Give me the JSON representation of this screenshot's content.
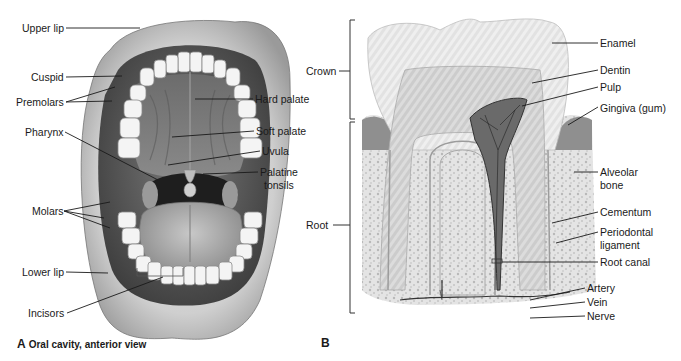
{
  "panel_a": {
    "letter": "A",
    "caption": "Oral cavity, anterior view",
    "labels": {
      "upper_lip": "Upper lip",
      "cuspid": "Cuspid",
      "premolars": "Premolars",
      "pharynx": "Pharynx",
      "molars": "Molars",
      "lower_lip": "Lower lip",
      "incisors": "Incisors",
      "hard_palate": "Hard palate",
      "soft_palate": "Soft palate",
      "uvula": "Uvula",
      "palatine_1": "Palatine",
      "palatine_2": "tonsils"
    }
  },
  "panel_b": {
    "letter": "B",
    "labels": {
      "crown": "Crown",
      "root": "Root",
      "enamel": "Enamel",
      "dentin": "Dentin",
      "pulp": "Pulp",
      "gingiva": "Gingiva (gum)",
      "alveolar_1": "Alveolar",
      "alveolar_2": "bone",
      "cementum": "Cementum",
      "periodontal_1": "Periodontal",
      "periodontal_2": "ligament",
      "root_canal": "Root canal",
      "artery": "Artery",
      "vein": "Vein",
      "nerve": "Nerve"
    }
  },
  "colors": {
    "line": "#1a1a1a",
    "background": "#ffffff"
  }
}
